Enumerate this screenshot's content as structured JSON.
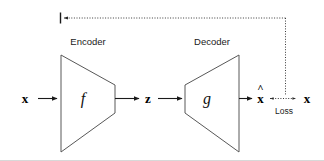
{
  "figure": {
    "background_color": "#ffffff",
    "stroke_color": "#585858",
    "text_color": "#1a1a1a"
  },
  "nodes": {
    "input": {
      "label": "x",
      "name": "input-variable-x"
    },
    "encoder": {
      "title": "Encoder",
      "function": "f",
      "name": "encoder-block"
    },
    "latent": {
      "label": "z",
      "name": "latent-variable-z"
    },
    "decoder": {
      "title": "Decoder",
      "function": "g",
      "name": "decoder-block"
    },
    "reconstruction": {
      "label": "x",
      "accent": "^",
      "name": "reconstruction-variable-xhat"
    },
    "target": {
      "label": "x",
      "name": "target-variable-x"
    }
  },
  "annotations": {
    "loss": {
      "label": "Loss",
      "name": "loss-label"
    },
    "feedback": {
      "name": "gradient-feedback-path"
    }
  },
  "arrows": [
    {
      "name": "arrow-x-to-encoder",
      "from": "x",
      "to": "Encoder",
      "style": "solid"
    },
    {
      "name": "arrow-encoder-to-z",
      "from": "Encoder",
      "to": "z",
      "style": "solid"
    },
    {
      "name": "arrow-z-to-decoder",
      "from": "z",
      "to": "Decoder",
      "style": "solid"
    },
    {
      "name": "arrow-decoder-to-xhat",
      "from": "Decoder",
      "to": "x-hat",
      "style": "solid"
    },
    {
      "name": "arrow-loss-compare",
      "from": "x-hat",
      "to": "x",
      "style": "dotted-bidirectional"
    },
    {
      "name": "arrow-feedback-to-encoder",
      "from": "Loss",
      "to": "Encoder",
      "style": "dotted"
    }
  ]
}
